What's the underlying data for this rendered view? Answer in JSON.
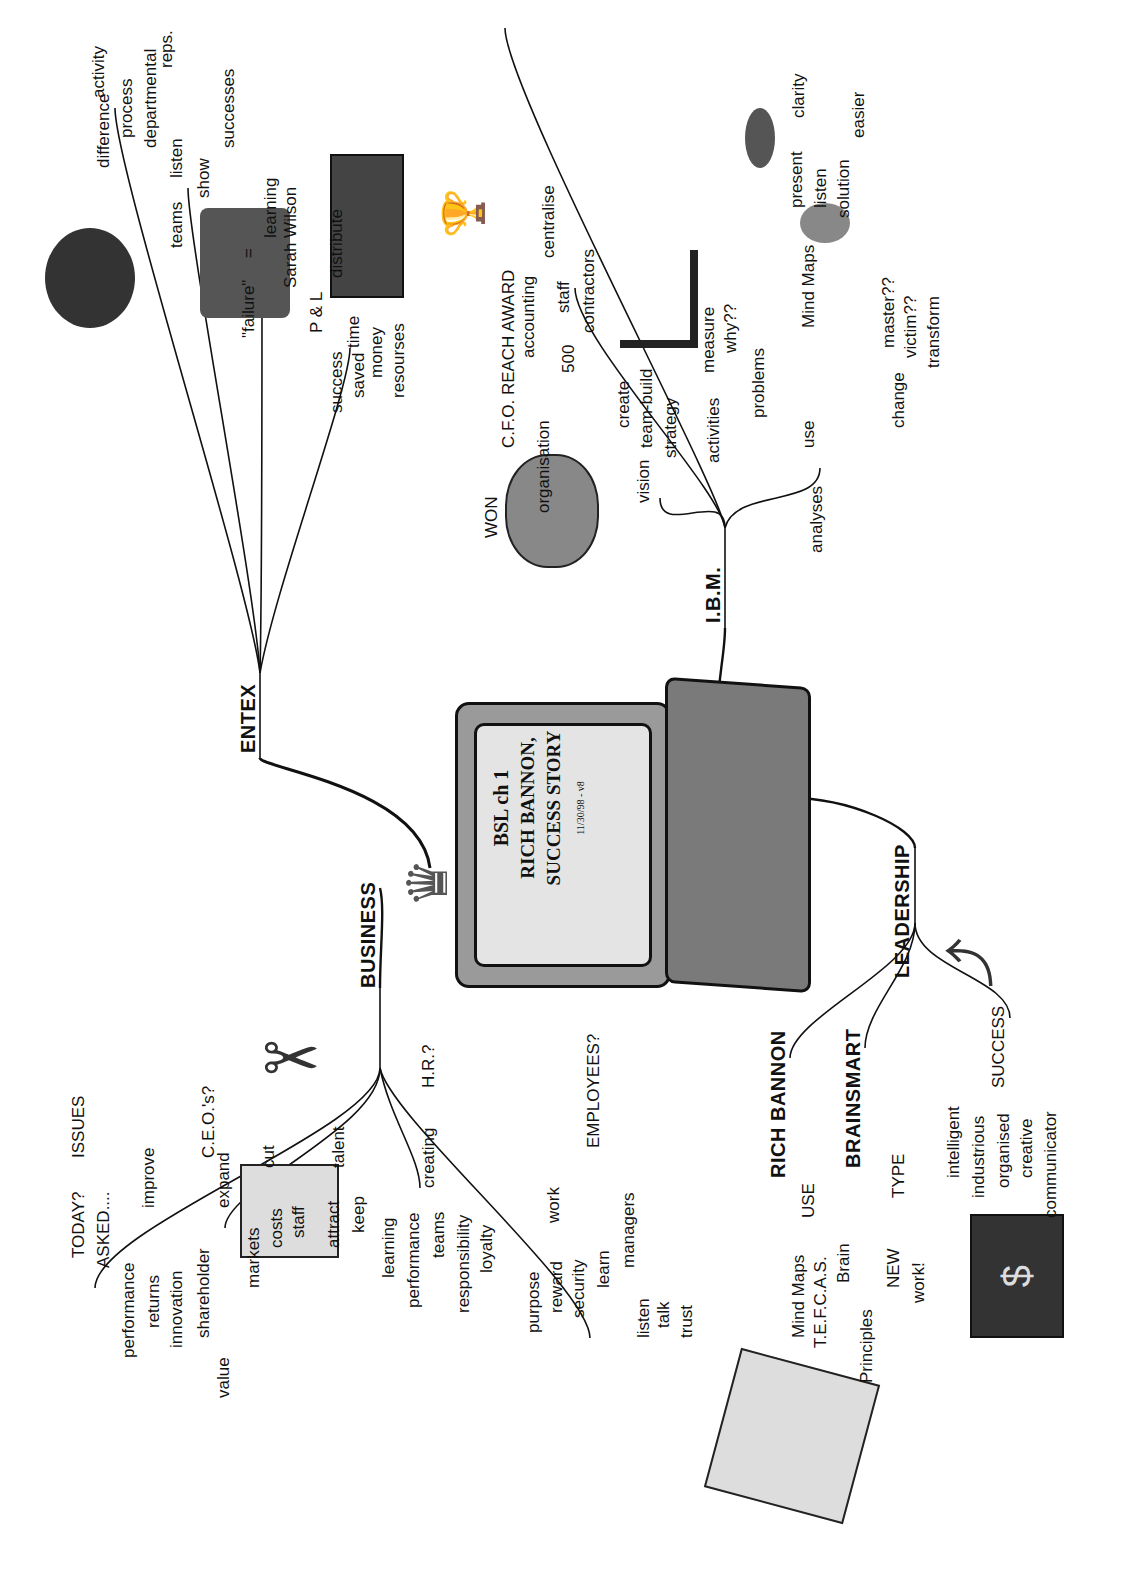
{
  "center": {
    "title_line1": "BSL  ch 1",
    "title_line2": "RICH BANNON,",
    "title_line3": "SUCCESS STORY",
    "date": "11/30/98 - v8"
  },
  "branches": {
    "entex": {
      "label": "ENTEX",
      "children": [
        {
          "label": "difference",
          "children": [
            "activity",
            "process"
          ]
        },
        {
          "label": "teams",
          "children": [
            "departmental",
            "reps.",
            "listen",
            "show",
            "successes"
          ]
        },
        {
          "label": "\"failure\"",
          "eq": "=",
          "children": [
            "learning"
          ]
        },
        {
          "label": "success",
          "children": [
            "Sarah Wilson",
            "P & L",
            "distribute",
            "saved",
            "time",
            "money",
            "resourses"
          ]
        }
      ]
    },
    "ibm": {
      "label": "I.B.M.",
      "children": [
        {
          "label": "WON",
          "children": [
            "C.F.O. REACH AWARD"
          ]
        },
        {
          "label": "organisation",
          "children": [
            "accounting",
            "centralise",
            "500",
            "staff",
            "contractors"
          ]
        },
        {
          "label": "vision",
          "children": [
            "create",
            "team-build",
            "strategy"
          ]
        },
        {
          "label": "analyses",
          "children": [
            "activities",
            "measure",
            "why??",
            "problems",
            "use",
            "Mind Maps",
            "present",
            "clarity",
            "listen",
            "solution",
            "easier",
            "change",
            "master??",
            "victim??",
            "transform"
          ]
        }
      ]
    },
    "business": {
      "label": "BUSINESS",
      "children": [
        {
          "label": "ISSUES",
          "children": [
            "TODAY?",
            "ASKED...."
          ]
        },
        {
          "label": "C.E.O.'s?",
          "children": [
            "improve",
            "performance",
            "returns",
            "innovation",
            "expand",
            "shareholder",
            "value",
            "markets",
            "cut",
            "costs",
            "staff"
          ]
        },
        {
          "label": "H.R.?",
          "children": [
            "talent",
            "attract",
            "keep",
            "creating",
            "learning",
            "performance",
            "teams",
            "responsibility",
            "loyalty"
          ]
        },
        {
          "label": "EMPLOYEES?",
          "children": [
            "work",
            "purpose",
            "reward",
            "security",
            "learn",
            "managers",
            "listen",
            "talk",
            "trust"
          ]
        }
      ]
    },
    "leadership": {
      "label": "LEADERSHIP",
      "children": [
        {
          "label": "RICH BANNON"
        },
        {
          "label": "BRAINSMART",
          "children": [
            "USE",
            "Mind Maps",
            "T.E.F.C.A.S.",
            "Brain",
            "Principles",
            "TYPE",
            "NEW",
            "work!"
          ]
        },
        {
          "label": "SUCCESS",
          "children": [
            "intelligent",
            "industrious",
            "organised",
            "creative",
            "communicator"
          ]
        }
      ]
    }
  },
  "labels": {
    "entex": "ENTEX",
    "difference": "difference",
    "activity": "activity",
    "process": "process",
    "teams": "teams",
    "departmental": "departmental",
    "reps": "reps.",
    "listen": "listen",
    "show": "show",
    "successes": "successes",
    "failure": "\"failure\"",
    "eq": "=",
    "learning": "learning",
    "success": "success",
    "sarah": "Sarah Wilson",
    "pl": "P & L",
    "distribute": "distribute",
    "saved": "saved",
    "time": "time",
    "money": "money",
    "resourses": "resourses",
    "ibm": "I.B.M.",
    "won": "WON",
    "cfo": "C.F.O. REACH AWARD",
    "organisation": "organisation",
    "accounting": "accounting",
    "centralise": "centralise",
    "n500": "500",
    "staff": "staff",
    "contractors": "contractors",
    "vision": "vision",
    "create": "create",
    "teambuild": "team-build",
    "strategy": "strategy",
    "analyses": "analyses",
    "activities": "activities",
    "measure": "measure",
    "why": "why??",
    "problems": "problems",
    "use": "use",
    "mindmaps": "Mind Maps",
    "present": "present",
    "clarity": "clarity",
    "listen2": "listen",
    "solution": "solution",
    "easier": "easier",
    "change": "change",
    "master": "master??",
    "victim": "victim??",
    "transform": "transform",
    "business": "BUSINESS",
    "issues": "ISSUES",
    "today": "TODAY?",
    "asked": "ASKED....",
    "ceos": "C.E.O.'s?",
    "improve": "improve",
    "performance": "performance",
    "returns": "returns",
    "innovation": "innovation",
    "expand": "expand",
    "shareholder": "shareholder",
    "value": "value",
    "markets": "markets",
    "cut": "cut",
    "costs": "costs",
    "staff2": "staff",
    "hr": "H.R.?",
    "talent": "talent",
    "attract": "attract",
    "keep": "keep",
    "creating": "creating",
    "learning2": "learning",
    "performance2": "performance",
    "teams2": "teams",
    "responsibility": "responsibility",
    "loyalty": "loyalty",
    "employees": "EMPLOYEES?",
    "work": "work",
    "purpose": "purpose",
    "reward": "reward",
    "security": "security",
    "learn": "learn",
    "managers": "managers",
    "listen3": "listen",
    "talk": "talk",
    "trust": "trust",
    "leadership": "LEADERSHIP",
    "richbannon": "RICH BANNON",
    "brainsmart": "BRAINSMART",
    "useU": "USE",
    "mindmaps2": "Mind Maps",
    "tefcas": "T.E.F.C.A.S.",
    "brain": "Brain",
    "principles": "Principles",
    "type": "TYPE",
    "new": "NEW",
    "workx": "work!",
    "successU": "SUCCESS",
    "intelligent": "intelligent",
    "industrious": "industrious",
    "organised": "organised",
    "creative": "creative",
    "communicator": "communicator"
  },
  "illustrations": [
    "top-hat-icon",
    "scissors-icon",
    "checklist-icon",
    "meditating-person-icon",
    "money-stack-icon",
    "trophy-icon",
    "growth-chart-icon",
    "lips-icon",
    "ear-icon",
    "brain-icon",
    "crown-icon",
    "laptop-icon",
    "curved-arrow-icon",
    "dollar-bill-icon",
    "mind-map-pages-icon"
  ],
  "colors": {
    "line": "#111111",
    "laptop_body": "#8a8a8a",
    "screen": "#e4e4e4",
    "dark": "#3a3a3a"
  }
}
